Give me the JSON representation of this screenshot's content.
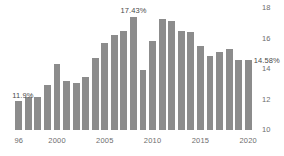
{
  "chart_data": {
    "type": "bar",
    "title": "",
    "xlabel": "",
    "ylabel": "",
    "ylim": [
      10,
      18
    ],
    "yticks": [
      10,
      12,
      14,
      16,
      18
    ],
    "ytick_labels": [
      "10",
      "12",
      "14",
      "16",
      "18"
    ],
    "xtick_labels": [
      "96",
      "2000",
      "2005",
      "2010",
      "2015",
      "2020"
    ],
    "xtick_categories": [
      "1996",
      "2000",
      "2005",
      "2010",
      "2015",
      "2020"
    ],
    "grid": false,
    "legend": null,
    "bar_color": "#8c8c8c",
    "axis_text_color": "#6d6d6d",
    "label_text_color": "#4a4a4a",
    "categories": [
      "1996",
      "1997",
      "1998",
      "1999",
      "2000",
      "2001",
      "2002",
      "2003",
      "2004",
      "2005",
      "2006",
      "2007",
      "2008",
      "2009",
      "2010",
      "2011",
      "2012",
      "2013",
      "2014",
      "2015",
      "2016",
      "2017",
      "2018",
      "2019",
      "2020"
    ],
    "values": [
      11.9,
      12.15,
      12.15,
      12.95,
      14.35,
      13.2,
      13.1,
      13.45,
      14.75,
      15.7,
      16.2,
      16.5,
      17.43,
      13.95,
      15.85,
      17.25,
      17.15,
      16.5,
      16.45,
      15.5,
      14.85,
      15.1,
      15.3,
      14.58,
      14.58
    ],
    "annotations": [
      {
        "category": "1996",
        "text": "11.9%"
      },
      {
        "category": "2008",
        "text": "17.43%"
      },
      {
        "category": "2020",
        "text": "14.58%"
      }
    ]
  }
}
